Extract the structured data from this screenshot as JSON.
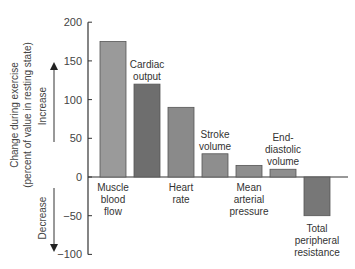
{
  "chart_data": {
    "type": "bar",
    "title": "",
    "xlabel": "",
    "ylabel": "Change during exercise (percent of value in resting state)",
    "ylabel_line1": "Change during exercise",
    "ylabel_line2": "(percent of value in resting state)",
    "ylim": [
      -100,
      200
    ],
    "yticks": [
      200,
      150,
      100,
      50,
      0,
      -50,
      -100
    ],
    "grid": false,
    "annotations": {
      "increase": "Increase",
      "decrease": "Decrease"
    },
    "categories": [
      "Muscle blood flow",
      "Cardiac output",
      "Heart rate",
      "Stroke volume",
      "Mean arterial pressure",
      "End-diastolic volume",
      "Total peripheral resistance"
    ],
    "category_lines": [
      [
        "Muscle",
        "blood",
        "flow"
      ],
      [
        "Cardiac",
        "output"
      ],
      [
        "Heart",
        "rate"
      ],
      [
        "Stroke",
        "volume"
      ],
      [
        "Mean",
        "arterial",
        "pressure"
      ],
      [
        "End-",
        "diastolic",
        "volume"
      ],
      [
        "Total",
        "peripheral",
        "resistance"
      ]
    ],
    "values": [
      175,
      120,
      90,
      30,
      15,
      10,
      -50
    ],
    "colors": [
      "#9a9a9a",
      "#6e6e6e",
      "#8a8a8a",
      "#8e8e8e",
      "#8e8e8e",
      "#8e8e8e",
      "#777777"
    ]
  }
}
